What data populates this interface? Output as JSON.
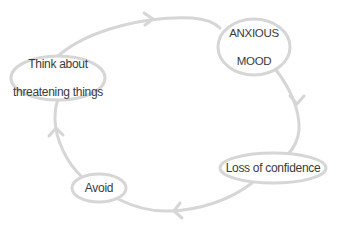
{
  "diagram": {
    "type": "cycle",
    "colors": {
      "stroke": "#d6d6d6",
      "text": "#3a3a3a",
      "background": "#ffffff"
    },
    "nodes": [
      {
        "id": "anxious-mood",
        "line1": "ANXIOUS",
        "line2": "MOOD",
        "label": "ANXIOUS MOOD"
      },
      {
        "id": "loss-of-confidence",
        "line1": "Loss of confidence",
        "label": "Loss of confidence"
      },
      {
        "id": "avoid",
        "line1": "Avoid",
        "label": "Avoid"
      },
      {
        "id": "think-about-threatening-things",
        "line1": "Think about",
        "line2": "threatening things",
        "label": "Think about threatening things"
      }
    ],
    "edges": [
      {
        "from": "think-about-threatening-things",
        "to": "anxious-mood",
        "direction": "clockwise"
      },
      {
        "from": "anxious-mood",
        "to": "loss-of-confidence",
        "direction": "clockwise"
      },
      {
        "from": "loss-of-confidence",
        "to": "avoid",
        "direction": "clockwise"
      },
      {
        "from": "avoid",
        "to": "think-about-threatening-things",
        "direction": "clockwise"
      }
    ]
  }
}
